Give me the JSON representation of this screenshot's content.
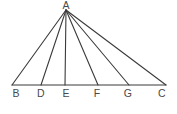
{
  "figure": {
    "background_color": "#ffffff",
    "line_color": "#3a3a3a",
    "label_color": "#4a4a4a",
    "apex": {
      "name": "A",
      "label": "A",
      "x": 66,
      "y": 10,
      "label_x": 66,
      "label_y": 0
    },
    "baseline": {
      "name": "BC",
      "y": 85,
      "x_start": 12,
      "x_end": 166
    },
    "base_points": [
      {
        "name": "B",
        "label": "B",
        "x": 12,
        "y": 85,
        "label_x": 16,
        "label_y": 88
      },
      {
        "name": "D",
        "label": "D",
        "x": 41,
        "y": 85,
        "label_x": 41,
        "label_y": 88
      },
      {
        "name": "E",
        "label": "E",
        "x": 65,
        "y": 85,
        "label_x": 66,
        "label_y": 88
      },
      {
        "name": "F",
        "label": "F",
        "x": 98,
        "y": 85,
        "label_x": 97,
        "label_y": 88
      },
      {
        "name": "G",
        "label": "G",
        "x": 129,
        "y": 85,
        "label_x": 128,
        "label_y": 88
      },
      {
        "name": "C",
        "label": "C",
        "x": 166,
        "y": 85,
        "label_x": 162,
        "label_y": 88
      }
    ],
    "cevians": [
      {
        "name": "AB",
        "from": "A",
        "to": "B"
      },
      {
        "name": "AD",
        "from": "A",
        "to": "D"
      },
      {
        "name": "AE",
        "from": "A",
        "to": "E"
      },
      {
        "name": "AF",
        "from": "A",
        "to": "F"
      },
      {
        "name": "AG",
        "from": "A",
        "to": "G"
      },
      {
        "name": "AC",
        "from": "A",
        "to": "C"
      }
    ]
  }
}
